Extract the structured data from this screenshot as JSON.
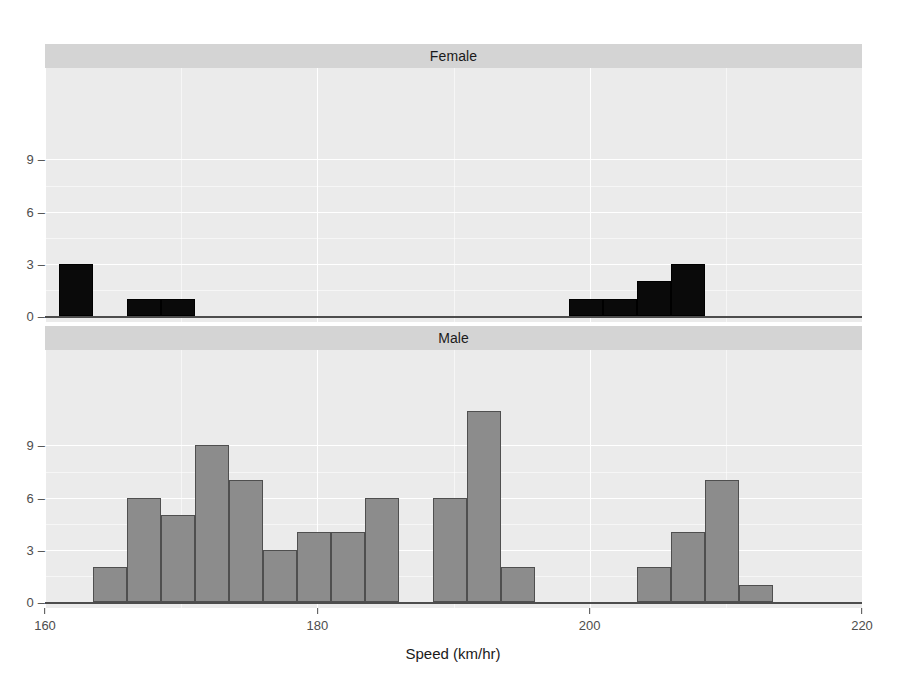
{
  "chart_data": {
    "type": "bar",
    "title": "",
    "xlabel": "Speed (km/hr)",
    "ylabel": "",
    "xlim": [
      160,
      220
    ],
    "ylim": [
      0,
      11
    ],
    "xticks": [
      160,
      180,
      200,
      220
    ],
    "xticklabels": [
      "160",
      "180",
      "200",
      "220"
    ],
    "yticks": [
      0,
      3,
      6,
      9
    ],
    "yticklabels": [
      "0",
      "3",
      "6",
      "9"
    ],
    "grid": true,
    "legend": null,
    "bin_width": 2.5,
    "panels": [
      {
        "label": "Female",
        "bar_color": "#0a0a0a",
        "bins": [
          {
            "x0": 161.0,
            "x1": 163.5,
            "count": 3
          },
          {
            "x0": 166.0,
            "x1": 168.5,
            "count": 1
          },
          {
            "x0": 168.5,
            "x1": 171.0,
            "count": 1
          },
          {
            "x0": 198.5,
            "x1": 201.0,
            "count": 1
          },
          {
            "x0": 201.0,
            "x1": 203.5,
            "count": 1
          },
          {
            "x0": 203.5,
            "x1": 206.0,
            "count": 2
          },
          {
            "x0": 206.0,
            "x1": 208.5,
            "count": 3
          }
        ]
      },
      {
        "label": "Male",
        "bar_color": "#8c8c8c",
        "bins": [
          {
            "x0": 163.5,
            "x1": 166.0,
            "count": 2
          },
          {
            "x0": 166.0,
            "x1": 168.5,
            "count": 6
          },
          {
            "x0": 168.5,
            "x1": 171.0,
            "count": 5
          },
          {
            "x0": 171.0,
            "x1": 173.5,
            "count": 9
          },
          {
            "x0": 173.5,
            "x1": 176.0,
            "count": 7
          },
          {
            "x0": 176.0,
            "x1": 178.5,
            "count": 3
          },
          {
            "x0": 178.5,
            "x1": 181.0,
            "count": 4
          },
          {
            "x0": 181.0,
            "x1": 183.5,
            "count": 4
          },
          {
            "x0": 183.5,
            "x1": 186.0,
            "count": 6
          },
          {
            "x0": 188.5,
            "x1": 191.0,
            "count": 6
          },
          {
            "x0": 191.0,
            "x1": 193.5,
            "count": 11
          },
          {
            "x0": 193.5,
            "x1": 196.0,
            "count": 2
          },
          {
            "x0": 203.5,
            "x1": 206.0,
            "count": 2
          },
          {
            "x0": 206.0,
            "x1": 208.5,
            "count": 4
          },
          {
            "x0": 208.5,
            "x1": 211.0,
            "count": 7
          },
          {
            "x0": 211.0,
            "x1": 213.5,
            "count": 1
          }
        ]
      }
    ]
  },
  "figure": {
    "background": "#ffffff",
    "panel_background": "#ebebeb",
    "strip_background": "#d4d4d4",
    "grid_color": "#ffffff",
    "axis_color": "#4d4d4d"
  }
}
